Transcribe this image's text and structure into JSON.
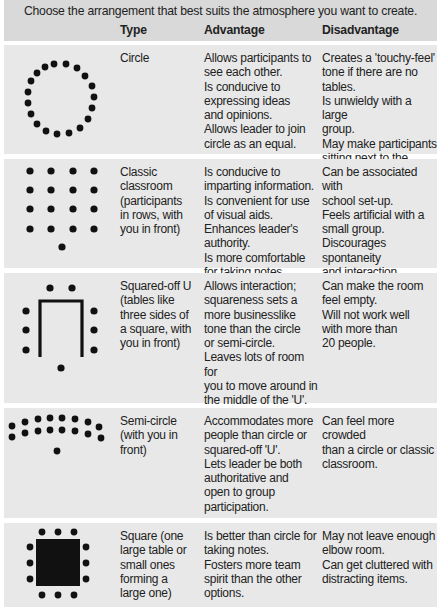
{
  "intro": "Choose the arrangement that best suits the atmosphere you want to create.",
  "columns": {
    "type": "Type",
    "advantage": "Advantage",
    "disadvantage": "Disadvantage"
  },
  "colors": {
    "header_bg": "#d9d9d9",
    "row_bg": "#e8e8e8",
    "text": "#222222",
    "diagram": "#111111"
  },
  "rows": [
    {
      "diagram": "circle-arrangement",
      "type": "Circle",
      "advantage": "Allows participants to\nsee each other.\nIs conducive to\nexpressing ideas\nand opinions.\nAllows leader to join\ncircle as an equal.",
      "disadvantage": "Creates a 'touchy-feel'\ntone if there are no tables.\nIs unwieldy with a large\ngroup.\nMay make participants\nsitting next to the leader\nfeel uncomfortable."
    },
    {
      "diagram": "classroom-arrangement",
      "type": "Classic\nclassroom\n(participants\nin rows, with\nyou in front)",
      "advantage": "Is conducive to\nimparting information.\nIs convenient for use\nof visual aids.\nEnhances leader's\nauthority.\nIs more comfortable\nfor taking notes.",
      "disadvantage": "Can be associated with\nschool set-up.\nFeels artificial with a\nsmall group.\nDiscourages spontaneity\nand interaction.\nMay make people at the\nback feel left out."
    },
    {
      "diagram": "u-shape-arrangement",
      "type": "Squared-off U\n(tables like\nthree sides of\na square, with\nyou in front)",
      "advantage": "Allows interaction;\nsquareness sets a\nmore businesslike\ntone than the circle\nor semi-circle.\nLeaves lots of room for\nyou to move around in\nthe middle of the 'U'.\nIs convenient for use\nof visual aids.",
      "disadvantage": "Can make the room\nfeel empty.\nWill not work well\nwith more than\n20 people."
    },
    {
      "diagram": "semi-circle-arrangement",
      "type": "Semi-circle\n(with you in\nfront)",
      "advantage": "Accommodates more\npeople than circle or\nsquared-off 'U'.\nLets leader be both\nauthoritative and\nopen to group\nparticipation.",
      "disadvantage": "Can feel more crowded\nthan a circle or classic\nclassroom."
    },
    {
      "diagram": "square-table-arrangement",
      "type": "Square (one\nlarge table or\nsmall ones\nforming a\nlarge one)",
      "advantage": "Is better than circle for\ntaking notes.\nFosters more team\nspirit than the other\noptions.",
      "disadvantage": "May not leave enough\nelbow room.\nCan get cluttered with\ndistracting items."
    }
  ]
}
